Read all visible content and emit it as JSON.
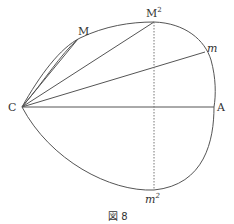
{
  "figure": {
    "caption": "図 8",
    "labels": {
      "C": "C",
      "A": "A",
      "M": "M",
      "M2": "M",
      "M2_sup": "2",
      "m": "m",
      "m2": "m",
      "m2_sup": "2"
    },
    "colors": {
      "stroke": "#555555",
      "text": "#333333",
      "background": "#ffffff"
    }
  }
}
